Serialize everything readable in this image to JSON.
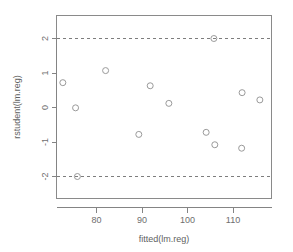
{
  "chart_data": {
    "type": "scatter",
    "title": "",
    "subtitle": "",
    "xlabel": "fitted(lm.reg)",
    "ylabel": "rstudent(lm.reg)",
    "xlim": [
      71,
      118
    ],
    "ylim": [
      -2.55,
      2.55
    ],
    "grid": false,
    "legend": null,
    "x_ticks": [
      80,
      90,
      100,
      110
    ],
    "x_tick_labels": [
      "80",
      "90",
      "100",
      "110"
    ],
    "y_ticks": [
      2,
      1,
      0,
      -1,
      -2
    ],
    "y_tick_labels": [
      "2",
      "1",
      "0",
      "-1",
      "-2"
    ],
    "annotations": [
      {
        "name": "upper-reference-line",
        "type": "hline",
        "y": 2,
        "style": "dashed"
      },
      {
        "name": "lower-reference-line",
        "type": "hline",
        "y": -2,
        "style": "dashed"
      }
    ],
    "marker": "open-circle",
    "marker_size": 3,
    "points": [
      {
        "x": 72.6,
        "y": 0.72
      },
      {
        "x": 75.4,
        "y": -0.01
      },
      {
        "x": 75.8,
        "y": -2.0
      },
      {
        "x": 82.0,
        "y": 1.07
      },
      {
        "x": 89.3,
        "y": -0.78
      },
      {
        "x": 91.8,
        "y": 0.63
      },
      {
        "x": 95.9,
        "y": 0.12
      },
      {
        "x": 104.1,
        "y": -0.72
      },
      {
        "x": 105.8,
        "y": 2.0
      },
      {
        "x": 106.0,
        "y": -1.08
      },
      {
        "x": 111.9,
        "y": -1.18
      },
      {
        "x": 112.0,
        "y": 0.43
      },
      {
        "x": 115.9,
        "y": 0.22
      }
    ]
  },
  "axes": {
    "x_title": "fitted(lm.reg)",
    "y_title": "rstudent(lm.reg)"
  },
  "ticks": {
    "x": [
      "80",
      "90",
      "100",
      "110"
    ],
    "y": [
      "2",
      "1",
      "0",
      "-1",
      "-2"
    ]
  },
  "colors": {
    "frame": "#8a8a8a",
    "point_stroke": "#9a9a9a",
    "reference_line": "#7d7d7d",
    "text": "#6e6e6e",
    "background": "#ffffff"
  }
}
